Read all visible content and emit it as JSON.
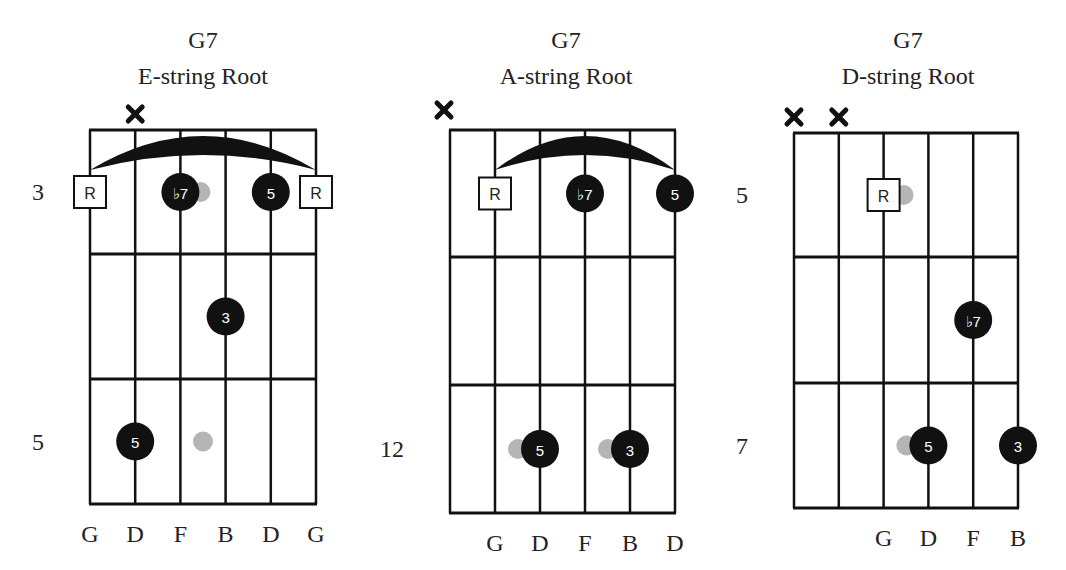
{
  "diagrams": [
    {
      "id": "e-string-root",
      "title": "G7",
      "subtitle": "E-string Root",
      "string_names": [
        "G",
        "D",
        "F",
        "B",
        "D",
        "G"
      ],
      "muted_strings": [
        2
      ],
      "barre": {
        "from_string": 1,
        "to_string": 6,
        "fret_row": 1
      },
      "fret_labels": [
        {
          "row": 1,
          "label": "3"
        },
        {
          "row": 3,
          "label": "5"
        }
      ],
      "notes": [
        {
          "string": 1,
          "row": 1,
          "type": "root",
          "label": "R"
        },
        {
          "string": 3,
          "row": 1,
          "type": "note",
          "label": "♭7",
          "ghost_offset": "right"
        },
        {
          "string": 5,
          "row": 1,
          "type": "note",
          "label": "5"
        },
        {
          "string": 6,
          "row": 1,
          "type": "root",
          "label": "R"
        },
        {
          "string": 4,
          "row": 2,
          "type": "note",
          "label": "3"
        },
        {
          "string": 2,
          "row": 3,
          "type": "note",
          "label": "5"
        },
        {
          "string": 3.5,
          "row": 3,
          "type": "ghost",
          "label": ""
        }
      ]
    },
    {
      "id": "a-string-root",
      "title": "G7",
      "subtitle": "A-string Root",
      "string_names": [
        "",
        "G",
        "D",
        "F",
        "B",
        "D"
      ],
      "muted_strings": [
        1
      ],
      "barre": {
        "from_string": 2,
        "to_string": 6,
        "fret_row": 1
      },
      "fret_labels": [
        {
          "row": 3,
          "label": "12"
        }
      ],
      "notes": [
        {
          "string": 2,
          "row": 1,
          "type": "root",
          "label": "R"
        },
        {
          "string": 4,
          "row": 1,
          "type": "note",
          "label": "♭7"
        },
        {
          "string": 6,
          "row": 1,
          "type": "note",
          "label": "5"
        },
        {
          "string": 3,
          "row": 3,
          "type": "note",
          "label": "5",
          "ghost_offset": "left"
        },
        {
          "string": 5,
          "row": 3,
          "type": "note",
          "label": "3",
          "ghost_offset": "left"
        }
      ]
    },
    {
      "id": "d-string-root",
      "title": "G7",
      "subtitle": "D-string Root",
      "string_names": [
        "",
        "",
        "G",
        "D",
        "F",
        "B"
      ],
      "muted_strings": [
        1,
        2
      ],
      "barre": null,
      "fret_labels": [
        {
          "row": 1,
          "label": "5"
        },
        {
          "row": 3,
          "label": "7"
        }
      ],
      "notes": [
        {
          "string": 3,
          "row": 1,
          "type": "root",
          "label": "R",
          "ghost_offset": "right"
        },
        {
          "string": 5,
          "row": 2,
          "type": "note",
          "label": "♭7"
        },
        {
          "string": 4,
          "row": 3,
          "type": "note",
          "label": "5",
          "ghost_offset": "left"
        },
        {
          "string": 6,
          "row": 3,
          "type": "note",
          "label": "3"
        }
      ]
    }
  ],
  "colors": {
    "ink": "#111111",
    "ghost": "#b5b5b5",
    "background": "#ffffff"
  }
}
